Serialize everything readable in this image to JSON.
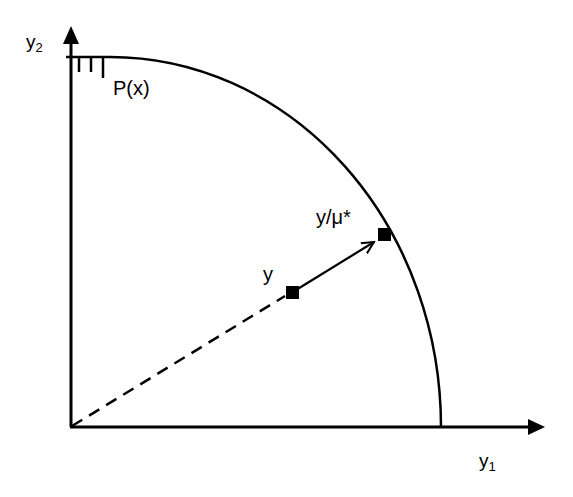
{
  "diagram": {
    "type": "production-possibility-set",
    "axes": {
      "y_axis": {
        "label": "y",
        "subscript": "2"
      },
      "x_axis": {
        "label": "y",
        "subscript": "1"
      }
    },
    "frontier_label": "P(x)",
    "points": [
      {
        "id": "y",
        "label": "y"
      },
      {
        "id": "y-scaled",
        "label": "y/μ*"
      }
    ],
    "colors": {
      "stroke": "#000000",
      "background": "#ffffff"
    }
  }
}
